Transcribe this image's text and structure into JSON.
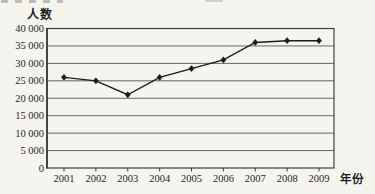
{
  "chart_data": {
    "type": "line",
    "title": "",
    "ylabel": "人数",
    "xlabel": "年份",
    "categories": [
      "2001",
      "2002",
      "2003",
      "2004",
      "2005",
      "2006",
      "2007",
      "2008",
      "2009"
    ],
    "values": [
      26000,
      25000,
      21000,
      26000,
      28500,
      31000,
      36000,
      36500,
      36500
    ],
    "ylim": [
      0,
      40000
    ],
    "y_tick_step": 5000,
    "y_tick_labels": [
      "0",
      "5 000",
      "10 000",
      "15 000",
      "20 000",
      "25 000",
      "30 000",
      "35 000",
      "40 000"
    ],
    "grid": "horizontal",
    "legend": "none",
    "marker": "diamond",
    "colors": {
      "line": "#1c1c1c",
      "marker": "#1c1c1c",
      "axis": "#3e3e3e",
      "grid": "#565656",
      "text": "#1f1f1f",
      "paper": "#f5f4ef"
    }
  }
}
